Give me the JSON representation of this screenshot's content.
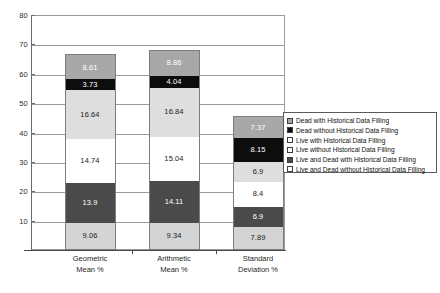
{
  "chart_data": {
    "type": "bar",
    "subtype": "stacked-bar",
    "title": "",
    "xlabel": "",
    "ylabel": "",
    "ylim": [
      0,
      80
    ],
    "ytick_step": 10,
    "yticks": [
      0,
      10,
      20,
      30,
      40,
      50,
      60,
      70,
      80
    ],
    "ytick_labels": [
      "",
      "10",
      "20",
      "30",
      "40",
      "50",
      "60",
      "70",
      "80"
    ],
    "grid": true,
    "grid_axis": "y",
    "legend_position": "right",
    "categories": [
      "Geometric\nMean %",
      "Arithmetic\nMean %",
      "Standard\nDeviation %"
    ],
    "category_lines": [
      [
        "Geometric",
        "Mean %"
      ],
      [
        "Arithmetic",
        "Mean %"
      ],
      [
        "Standard",
        "Deviation %"
      ]
    ],
    "series": [
      {
        "name": "Live and Dead without Historical Data Filling",
        "color": "#d4d4d4",
        "text_color": "#1a1a1a",
        "swatch": "#ffffff",
        "values": [
          9.06,
          9.34,
          7.89
        ],
        "labels": [
          "9.06",
          "9.34",
          "7.89"
        ]
      },
      {
        "name": "Live and Dead with Historical Data Filling",
        "color": "#4a4a4a",
        "text_color": "#ffffff",
        "swatch": "#4a4a4a",
        "values": [
          13.9,
          14.11,
          6.9
        ],
        "labels": [
          "13.9",
          "14.11",
          "6.9"
        ]
      },
      {
        "name": "Live without Historical Data Filling",
        "color": "#ffffff",
        "text_color": "#1a1a1a",
        "swatch": "#ffffff",
        "values": [
          14.74,
          15.04,
          8.4
        ],
        "labels": [
          "14.74",
          "15.04",
          "8.4"
        ]
      },
      {
        "name": "Live with Historical Data Filling",
        "color": "#dedede",
        "text_color": "#1a1a1a",
        "swatch": "#ffffff",
        "values": [
          16.64,
          16.84,
          6.9
        ],
        "labels": [
          "16.64",
          "16.84",
          "6.9"
        ]
      },
      {
        "name": "Dead without Historical Data Filling",
        "color": "#0d0d0d",
        "text_color": "#ffffff",
        "swatch": "#0d0d0d",
        "values": [
          3.73,
          4.04,
          8.15
        ],
        "labels": [
          "3.73",
          "4.04",
          "8.15"
        ]
      },
      {
        "name": "Dead with Historical Data Filling",
        "color": "#a8a8a8",
        "text_color": "#ffffff",
        "swatch": "#a8a8a8",
        "values": [
          8.61,
          8.86,
          7.37
        ],
        "labels": [
          "8.61",
          "8.86",
          "7.37"
        ]
      }
    ],
    "totals": [
      66.68,
      68.23,
      45.61
    ],
    "legend_order_top_down": [
      "Dead with Historical Data Filling",
      "Dead without Historical Data Filling",
      "Live with Historical Data Filling",
      "Live without Historical Data Filling",
      "Live and Dead with Historical Data Filling",
      "Live and Dead without Historical Data Filling"
    ]
  },
  "legend": {
    "items": [
      {
        "label": "Dead with Historical Data Filling",
        "swatch": "#a8a8a8"
      },
      {
        "label": "Dead without Historical Data Filling",
        "swatch": "#0d0d0d"
      },
      {
        "label": "Live with Historical Data Filling",
        "swatch": "#ffffff"
      },
      {
        "label": "Live without Historical Data Filling",
        "swatch": "#ffffff"
      },
      {
        "label": "Live and Dead with Historical Data Filling",
        "swatch": "#4a4a4a"
      },
      {
        "label": "Live and Dead without Historical Data Filling",
        "swatch": "#ffffff"
      }
    ]
  },
  "colors": {
    "axis": "#6b6b6b",
    "grid": "#9a9a9a",
    "frame": "#9a9a9a",
    "legend_border": "#5a5a5a",
    "background": "#ffffff"
  }
}
